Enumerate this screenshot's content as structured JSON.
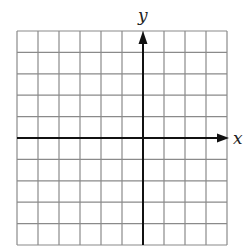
{
  "diagram": {
    "type": "coordinate-plane",
    "grid": {
      "columns": 10,
      "rows": 10,
      "left": 17,
      "top": 31,
      "right": 227,
      "bottom": 245,
      "line_color": "#8a8a8a",
      "y_axis_column": 6,
      "x_axis_row": 5
    },
    "axes": {
      "color": "#111111",
      "x_label": "x",
      "y_label": "y"
    }
  }
}
